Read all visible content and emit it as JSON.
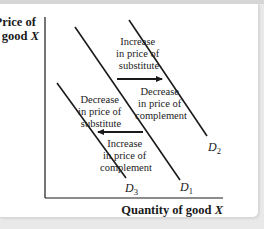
{
  "diagram": {
    "y_axis": {
      "line1": "Price of",
      "line2_text": "good ",
      "line2_var": "X"
    },
    "x_axis": {
      "text": "Quantity of good ",
      "var": "X"
    },
    "curves": [
      {
        "id": "D1",
        "letter": "D",
        "subscript": "1"
      },
      {
        "id": "D2",
        "letter": "D",
        "subscript": "2"
      },
      {
        "id": "D3",
        "letter": "D",
        "subscript": "3"
      }
    ],
    "annotations": {
      "rightward": {
        "above": [
          "Increase",
          "in price of",
          "substitute"
        ],
        "below": [
          "Decrease",
          "in price of",
          "complement"
        ]
      },
      "leftward": {
        "above": [
          "Decrease",
          "in price of",
          "substitute"
        ],
        "below": [
          "Increase",
          "in price of",
          "complement"
        ]
      }
    },
    "colors": {
      "line": "#1a1a1a",
      "background": "#ffffff"
    }
  }
}
